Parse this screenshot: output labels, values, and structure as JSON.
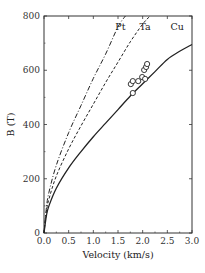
{
  "chart_data": {
    "type": "line",
    "title": "",
    "xlabel": "Velocity (km/s)",
    "ylabel": "B (T)",
    "xlim": [
      0.0,
      3.0
    ],
    "ylim": [
      0,
      800
    ],
    "xticks": [
      "0.0",
      "0.5",
      "1.0",
      "1.5",
      "2.0",
      "2.5",
      "3.0"
    ],
    "yticks": [
      "0",
      "200",
      "400",
      "600",
      "800"
    ],
    "grid": false,
    "legend": "inline labels at top",
    "series": [
      {
        "name": "Pt",
        "style": "dash-dot",
        "x": [
          0.0,
          0.05,
          0.1,
          0.25,
          0.5,
          0.75,
          1.0,
          1.25,
          1.5,
          1.65
        ],
        "y": [
          0,
          95,
          150,
          250,
          370,
          470,
          570,
          660,
          760,
          800
        ]
      },
      {
        "name": "Ta",
        "style": "dashed",
        "x": [
          0.0,
          0.05,
          0.1,
          0.25,
          0.5,
          0.75,
          1.0,
          1.25,
          1.5,
          1.75,
          2.0,
          2.15
        ],
        "y": [
          0,
          80,
          125,
          210,
          310,
          395,
          475,
          555,
          630,
          705,
          770,
          800
        ]
      },
      {
        "name": "Cu",
        "style": "solid",
        "x": [
          0.0,
          0.05,
          0.1,
          0.25,
          0.5,
          0.75,
          1.0,
          1.25,
          1.5,
          1.75,
          2.0,
          2.25,
          2.5,
          2.75,
          3.0
        ],
        "y": [
          0,
          65,
          100,
          165,
          240,
          300,
          355,
          405,
          455,
          505,
          550,
          595,
          640,
          670,
          695
        ]
      },
      {
        "name": "Experimental data",
        "style": "open-circle markers",
        "x": [
          1.8,
          1.76,
          1.8,
          1.91,
          1.99,
          2.05,
          2.03,
          2.07,
          2.09
        ],
        "y": [
          516,
          549,
          560,
          560,
          575,
          568,
          601,
          612,
          623
        ]
      }
    ],
    "annotations": [
      {
        "text": "Pt",
        "x": 1.55,
        "y": 760
      },
      {
        "text": "Ta",
        "x": 2.05,
        "y": 760
      },
      {
        "text": "Cu",
        "x": 2.7,
        "y": 760
      }
    ]
  }
}
